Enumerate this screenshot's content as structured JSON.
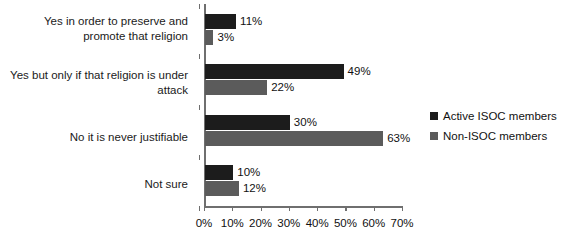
{
  "chart_data": {
    "type": "bar",
    "orientation": "horizontal",
    "title": "",
    "subtitle": "",
    "xlabel": "",
    "ylabel": "",
    "categories": [
      "Yes in order to preserve and promote that religion",
      "Yes but only if that religion is under attack",
      "No it is never justifiable",
      "Not sure"
    ],
    "series": [
      {
        "name": "Active ISOC members",
        "color": "#1c1c1c",
        "values": [
          11,
          49,
          30,
          10
        ]
      },
      {
        "name": "Non-ISOC members",
        "color": "#5b5b5b",
        "values": [
          3,
          22,
          63,
          12
        ]
      }
    ],
    "data_labels": [
      [
        "11%",
        "49%",
        "30%",
        "10%"
      ],
      [
        "3%",
        "22%",
        "63%",
        "12%"
      ]
    ],
    "xlim": [
      0,
      70
    ],
    "xticks": [
      0,
      10,
      20,
      30,
      40,
      50,
      60,
      70
    ],
    "xtick_labels": [
      "0%",
      "10%",
      "20%",
      "30%",
      "40%",
      "50%",
      "60%",
      "70%"
    ],
    "grid": false,
    "legend_position": "right"
  },
  "legend": {
    "items": [
      {
        "label": "Active ISOC members",
        "color": "#1c1c1c"
      },
      {
        "label": "Non-ISOC members",
        "color": "#5b5b5b"
      }
    ]
  }
}
